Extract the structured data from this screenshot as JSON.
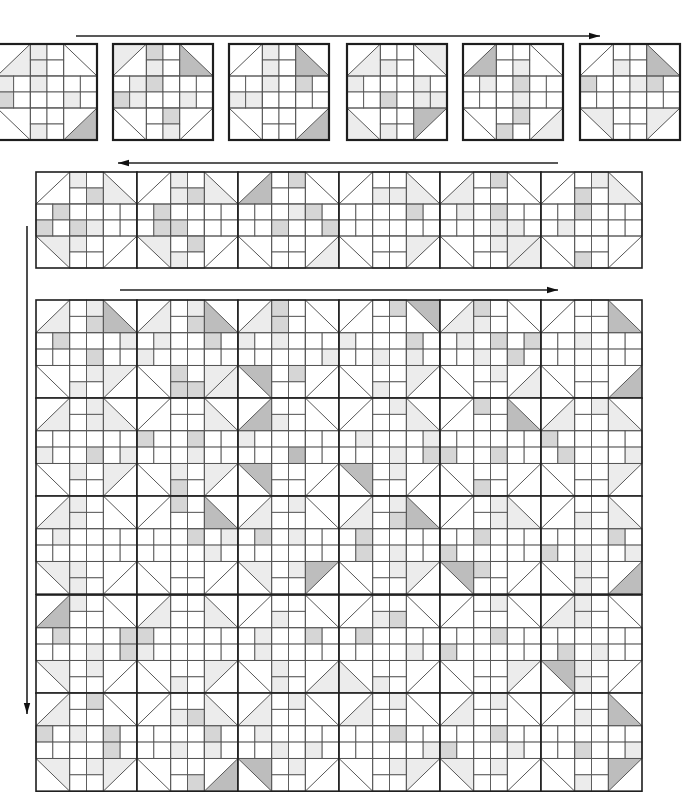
{
  "diagram": {
    "title": "",
    "colors": {
      "background": "#ffffff",
      "line": "#555555",
      "border": "#1e1e1e",
      "shades": [
        "#ffffff",
        "#ececec",
        "#d6d6d6",
        "#bdbdbd"
      ]
    },
    "arrows": [
      {
        "id": "row1-arrow",
        "direction": "right",
        "x1": 76,
        "y1": 36,
        "x2": 600,
        "y2": 36
      },
      {
        "id": "row2-arrow",
        "direction": "left",
        "x1": 558,
        "y1": 163,
        "x2": 118,
        "y2": 163
      },
      {
        "id": "column-arrow",
        "direction": "down",
        "x1": 27,
        "y1": 226,
        "x2": 27,
        "y2": 714
      },
      {
        "id": "grid-arrow",
        "direction": "right",
        "x1": 120,
        "y1": 290,
        "x2": 558,
        "y2": 290
      }
    ],
    "stage1_separate_blocks": {
      "y": 44,
      "w": 100,
      "h": 96,
      "xs": [
        -3,
        113,
        229,
        347,
        463,
        580
      ],
      "blocks": [
        "01000030101010100020001000101",
        "10030000201001200021001002010",
        "00030030101000102011000000000",
        "01101003001010001000201100100",
        "03000010000101020000010002202",
        "00030101001020012000000000000"
      ]
    },
    "stage2_joined_row": {
      "x": 36,
      "y": 172,
      "w": 101,
      "h": 96,
      "cols": 6,
      "blocks": [
        "00010100100202000020210010002",
        "00010100101202000002200002102",
        "03000010020000012000200200002",
        "00010001001100002000000000000",
        "01000011020001020000011001000",
        "00010000012000200001000000203"
      ]
    },
    "stage3_quilt_top": {
      "x": 36,
      "y": 300,
      "w": 101,
      "h": 98.2,
      "cols": 6,
      "rows": 5,
      "blocks": [
        "01030001010202000100020001101",
        "01030011010201002010000020220",
        "01000300202010100000000102000",
        "00300001020010002000101000101",
        "01000010201001020200102001000",
        "00030030000000100000000000000",
        "01010001010100000010020110000",
        "00010001000020020000010010202",
        "03000300001010000000030000002",
        "00010300010001000100010201000",
        "00030000200000000020020000201",
        "01010001010020000002000100000",
        "01000100101001000000000010100",
        "00030000200000020100001000000",
        "01000103010002010000000001000",
        "01030001010202000002010001000",
        "00010300010100200020000020000",
        "00010030001000002020100110100",
        "03000100100002000200010201000",
        "01010001000020000010000000100",
        "00000010001001002001000010100",
        "00001000001202000000001000100",
        "00000001010000020020000000000",
        "01000300101000000002010010100",
        "01000101020020102000002001000",
        "00010030001200002000101000020",
        "01000300010001000000101001000",
        "01000001010000020000000101000",
        "01000100010000020020001001001",
        "00030003001000000000200100100"
      ]
    }
  }
}
